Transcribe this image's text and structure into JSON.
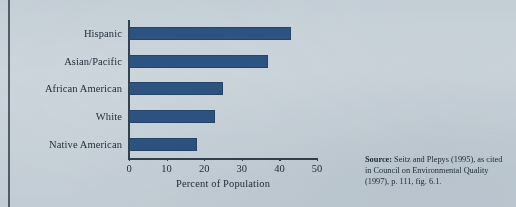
{
  "figure": {
    "background_color": "#ccd5dc",
    "bar_color": "#2d5482",
    "axis_color": "#33414f",
    "text_color": "#1d2b3a"
  },
  "source_note": {
    "label": "Source:",
    "text": " Seitz and Plepys (1995), as cited in Council on Environmental Quality (1997), p. 111, fig. 6.1."
  },
  "chart_data": {
    "type": "bar",
    "orientation": "horizontal",
    "title": "",
    "subtitle": "",
    "xlabel": "Percent of Population",
    "ylabel": "",
    "categories": [
      "Hispanic",
      "Asian/Pacific",
      "African American",
      "White",
      "Native American"
    ],
    "values": [
      43,
      37,
      25,
      23,
      18
    ],
    "xlim": [
      0,
      50
    ],
    "xticks": [
      0,
      10,
      20,
      30,
      40,
      50
    ],
    "xtick_labels": [
      "0",
      "10",
      "20",
      "30",
      "40",
      "50"
    ],
    "grid": false,
    "legend": null,
    "series": [
      {
        "name": "Percent of Population",
        "values": [
          43,
          37,
          25,
          23,
          18
        ],
        "color": "#2d5482"
      }
    ],
    "annotations": []
  }
}
